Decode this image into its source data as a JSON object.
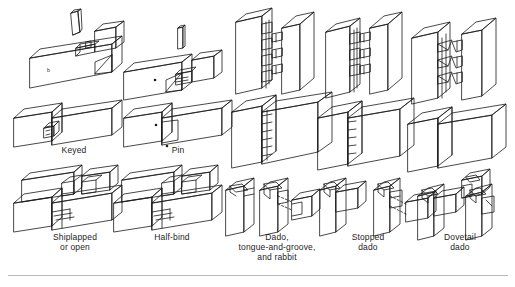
{
  "figure": {
    "background_color": "#ffffff",
    "line_color": "#1a1a1a",
    "rule_color": "#b9b9b9"
  },
  "captions": [
    {
      "id": "keyed",
      "label": "Keyed",
      "x": 38,
      "y": 145,
      "w": 72
    },
    {
      "id": "pin",
      "label": "Pin",
      "x": 152,
      "y": 145,
      "w": 52
    },
    {
      "id": "shiplapped",
      "label": "Shiplapped\nor open",
      "x": 30,
      "y": 232,
      "w": 90
    },
    {
      "id": "half-bind",
      "label": "Half-bind",
      "x": 132,
      "y": 232,
      "w": 80
    },
    {
      "id": "dado",
      "label": "Dado,\ntongue-and-groove,\nand rabbit",
      "x": 222,
      "y": 232,
      "w": 110
    },
    {
      "id": "stopped-dado",
      "label": "Stopped\ndado",
      "x": 330,
      "y": 232,
      "w": 76
    },
    {
      "id": "dovetail-dado",
      "label": "Dovetail\ndado",
      "x": 420,
      "y": 232,
      "w": 80
    }
  ],
  "joint_groups": [
    {
      "id": "keyed-group",
      "label": "Keyed",
      "exploded": true,
      "assembled": true
    },
    {
      "id": "pin-group",
      "label": "Pin",
      "exploded": true,
      "assembled": true
    },
    {
      "id": "shiplapped-group",
      "label": "Shiplapped or open",
      "exploded": true,
      "assembled": true
    },
    {
      "id": "half-bind-group",
      "label": "Half-bind",
      "exploded": true,
      "assembled": true
    },
    {
      "id": "finger-joint-group",
      "label": "Dado, tongue-and-groove, and rabbit",
      "exploded": true,
      "assembled": true
    },
    {
      "id": "box-joint-group",
      "label": "Stopped dado",
      "exploded": true,
      "assembled": true
    },
    {
      "id": "dovetail-group",
      "label": "Dovetail dado",
      "exploded": true,
      "assembled": true
    }
  ],
  "rule": {
    "x": 8,
    "y": 275,
    "w": 500
  }
}
